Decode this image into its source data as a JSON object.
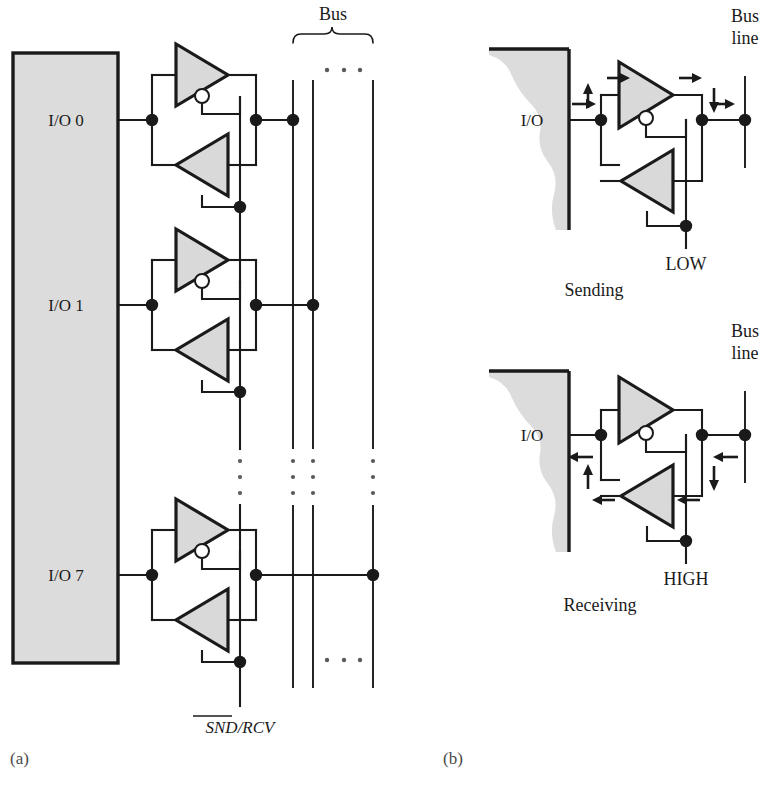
{
  "figure": {
    "panel_a_label": "(a)",
    "panel_b_label": "(b)"
  },
  "panel_a": {
    "chip_ports": [
      {
        "label": "I/O 0",
        "bus_line": 1
      },
      {
        "label": "I/O 1",
        "bus_line": 2
      },
      {
        "label": "I/O 7",
        "bus_line": 3
      }
    ],
    "bus_label": "Bus",
    "bus_line_count": 3,
    "bus_ellipsis": "· · ·",
    "control_label": "SND/RCV",
    "control_overbar_text": "SND",
    "vertical_ellipsis": "⋮"
  },
  "panel_b": {
    "diagrams": [
      {
        "caption": "Sending",
        "io_label": "I/O",
        "bus_label_line1": "Bus",
        "bus_label_line2": "line",
        "control_state": "LOW",
        "direction": "io-to-bus"
      },
      {
        "caption": "Receiving",
        "io_label": "I/O",
        "bus_label_line1": "Bus",
        "bus_label_line2": "line",
        "control_state": "HIGH",
        "direction": "bus-to-io"
      }
    ]
  },
  "colors": {
    "buffer_fill": "#d9d9d9",
    "chip_fill": "#dcdcdc",
    "line": "#1a1a1a",
    "background": "#ffffff"
  }
}
